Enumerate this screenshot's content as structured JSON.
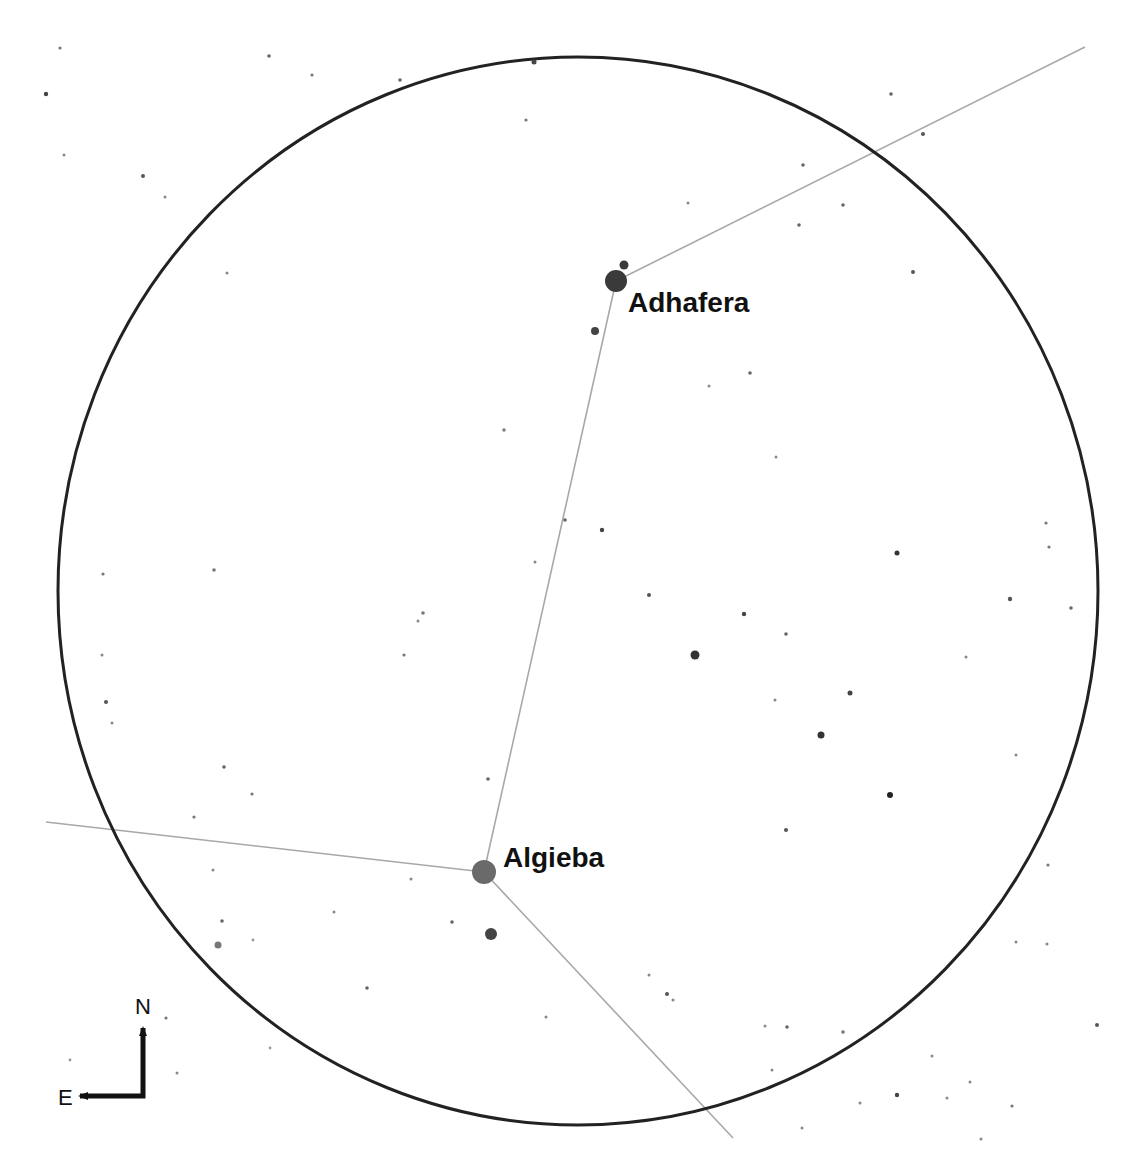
{
  "chart_title": "",
  "field_of_view": {
    "shape": "circle",
    "cx": 578,
    "cy": 591,
    "rx": 520,
    "ry": 534,
    "stroke": "#222222",
    "stroke_width": 3
  },
  "constellation_lines": {
    "color": "#a8a8a8",
    "width": 1.6,
    "segments": [
      {
        "from": [
          616,
          281
        ],
        "to": [
          1085,
          47
        ]
      },
      {
        "from": [
          616,
          281
        ],
        "to": [
          484,
          872
        ]
      },
      {
        "from": [
          484,
          872
        ],
        "to": [
          46,
          822
        ]
      },
      {
        "from": [
          484,
          872
        ],
        "to": [
          733,
          1138
        ]
      }
    ]
  },
  "named_stars": [
    {
      "name": "Adhafera",
      "x": 616,
      "y": 281,
      "r": 11,
      "color": "#3a3a3a",
      "label_x": 628,
      "label_y": 289
    },
    {
      "name": "Algieba",
      "x": 484,
      "y": 872,
      "r": 12,
      "color": "#6a6a6a",
      "label_x": 503,
      "label_y": 844
    }
  ],
  "stars": [
    {
      "x": 624,
      "y": 265,
      "r": 4.5,
      "c": "#3a3a3a"
    },
    {
      "x": 595,
      "y": 331,
      "r": 4,
      "c": "#444"
    },
    {
      "x": 491,
      "y": 934,
      "r": 6,
      "c": "#444"
    },
    {
      "x": 695,
      "y": 655,
      "r": 4.5,
      "c": "#333"
    },
    {
      "x": 821,
      "y": 735,
      "r": 3.5,
      "c": "#333"
    },
    {
      "x": 890,
      "y": 795,
      "r": 3,
      "c": "#222"
    },
    {
      "x": 218,
      "y": 945,
      "r": 3.5,
      "c": "#777"
    },
    {
      "x": 897,
      "y": 553,
      "r": 2.5,
      "c": "#333"
    },
    {
      "x": 850,
      "y": 693,
      "r": 2.5,
      "c": "#444"
    },
    {
      "x": 744,
      "y": 614,
      "r": 2.2,
      "c": "#444"
    },
    {
      "x": 649,
      "y": 595,
      "r": 2,
      "c": "#555"
    },
    {
      "x": 602,
      "y": 530,
      "r": 2.2,
      "c": "#444"
    },
    {
      "x": 565,
      "y": 520,
      "r": 1.8,
      "c": "#666"
    },
    {
      "x": 786,
      "y": 634,
      "r": 1.8,
      "c": "#666"
    },
    {
      "x": 775,
      "y": 700,
      "r": 1.5,
      "c": "#888"
    },
    {
      "x": 60,
      "y": 48,
      "r": 1.6,
      "c": "#777"
    },
    {
      "x": 46,
      "y": 94,
      "r": 2.2,
      "c": "#444"
    },
    {
      "x": 269,
      "y": 56,
      "r": 1.8,
      "c": "#666"
    },
    {
      "x": 312,
      "y": 75,
      "r": 1.6,
      "c": "#777"
    },
    {
      "x": 400,
      "y": 80,
      "r": 1.8,
      "c": "#666"
    },
    {
      "x": 534,
      "y": 62,
      "r": 2.5,
      "c": "#444"
    },
    {
      "x": 526,
      "y": 120,
      "r": 1.6,
      "c": "#777"
    },
    {
      "x": 64,
      "y": 155,
      "r": 1.5,
      "c": "#888"
    },
    {
      "x": 143,
      "y": 176,
      "r": 2,
      "c": "#555"
    },
    {
      "x": 165,
      "y": 197,
      "r": 1.5,
      "c": "#888"
    },
    {
      "x": 227,
      "y": 273,
      "r": 1.5,
      "c": "#888"
    },
    {
      "x": 504,
      "y": 430,
      "r": 1.7,
      "c": "#777"
    },
    {
      "x": 535,
      "y": 562,
      "r": 1.5,
      "c": "#888"
    },
    {
      "x": 891,
      "y": 94,
      "r": 1.8,
      "c": "#666"
    },
    {
      "x": 923,
      "y": 134,
      "r": 2,
      "c": "#555"
    },
    {
      "x": 803,
      "y": 165,
      "r": 1.8,
      "c": "#666"
    },
    {
      "x": 688,
      "y": 203,
      "r": 1.5,
      "c": "#888"
    },
    {
      "x": 843,
      "y": 205,
      "r": 1.8,
      "c": "#666"
    },
    {
      "x": 799,
      "y": 225,
      "r": 1.8,
      "c": "#666"
    },
    {
      "x": 913,
      "y": 272,
      "r": 2,
      "c": "#555"
    },
    {
      "x": 750,
      "y": 373,
      "r": 1.8,
      "c": "#666"
    },
    {
      "x": 709,
      "y": 386,
      "r": 1.5,
      "c": "#888"
    },
    {
      "x": 776,
      "y": 457,
      "r": 1.5,
      "c": "#888"
    },
    {
      "x": 1046,
      "y": 523,
      "r": 1.6,
      "c": "#777"
    },
    {
      "x": 1049,
      "y": 547,
      "r": 1.6,
      "c": "#777"
    },
    {
      "x": 1010,
      "y": 599,
      "r": 2.2,
      "c": "#555"
    },
    {
      "x": 1071,
      "y": 608,
      "r": 1.8,
      "c": "#666"
    },
    {
      "x": 966,
      "y": 657,
      "r": 1.5,
      "c": "#888"
    },
    {
      "x": 1016,
      "y": 755,
      "r": 1.5,
      "c": "#888"
    },
    {
      "x": 103,
      "y": 574,
      "r": 1.6,
      "c": "#777"
    },
    {
      "x": 214,
      "y": 570,
      "r": 1.8,
      "c": "#777"
    },
    {
      "x": 423,
      "y": 613,
      "r": 1.8,
      "c": "#777"
    },
    {
      "x": 418,
      "y": 621,
      "r": 1.5,
      "c": "#888"
    },
    {
      "x": 404,
      "y": 655,
      "r": 1.6,
      "c": "#777"
    },
    {
      "x": 102,
      "y": 655,
      "r": 1.5,
      "c": "#888"
    },
    {
      "x": 106,
      "y": 702,
      "r": 2,
      "c": "#555"
    },
    {
      "x": 112,
      "y": 723,
      "r": 1.5,
      "c": "#888"
    },
    {
      "x": 224,
      "y": 767,
      "r": 1.8,
      "c": "#666"
    },
    {
      "x": 252,
      "y": 794,
      "r": 1.6,
      "c": "#777"
    },
    {
      "x": 194,
      "y": 817,
      "r": 1.6,
      "c": "#777"
    },
    {
      "x": 488,
      "y": 779,
      "r": 1.8,
      "c": "#666"
    },
    {
      "x": 213,
      "y": 870,
      "r": 1.5,
      "c": "#888"
    },
    {
      "x": 222,
      "y": 921,
      "r": 1.8,
      "c": "#666"
    },
    {
      "x": 253,
      "y": 940,
      "r": 1.4,
      "c": "#999"
    },
    {
      "x": 334,
      "y": 912,
      "r": 1.5,
      "c": "#888"
    },
    {
      "x": 411,
      "y": 879,
      "r": 1.5,
      "c": "#888"
    },
    {
      "x": 452,
      "y": 922,
      "r": 1.8,
      "c": "#666"
    },
    {
      "x": 367,
      "y": 988,
      "r": 1.8,
      "c": "#666"
    },
    {
      "x": 166,
      "y": 1018,
      "r": 1.6,
      "c": "#777"
    },
    {
      "x": 270,
      "y": 1048,
      "r": 1.4,
      "c": "#999"
    },
    {
      "x": 177,
      "y": 1073,
      "r": 1.5,
      "c": "#888"
    },
    {
      "x": 70,
      "y": 1060,
      "r": 1.4,
      "c": "#999"
    },
    {
      "x": 786,
      "y": 830,
      "r": 2,
      "c": "#555"
    },
    {
      "x": 649,
      "y": 975,
      "r": 1.5,
      "c": "#888"
    },
    {
      "x": 667,
      "y": 994,
      "r": 2,
      "c": "#555"
    },
    {
      "x": 673,
      "y": 1000,
      "r": 1.5,
      "c": "#888"
    },
    {
      "x": 546,
      "y": 1017,
      "r": 1.5,
      "c": "#888"
    },
    {
      "x": 765,
      "y": 1026,
      "r": 1.5,
      "c": "#888"
    },
    {
      "x": 787,
      "y": 1027,
      "r": 1.8,
      "c": "#666"
    },
    {
      "x": 843,
      "y": 1032,
      "r": 1.8,
      "c": "#777"
    },
    {
      "x": 772,
      "y": 1070,
      "r": 1.5,
      "c": "#888"
    },
    {
      "x": 1048,
      "y": 865,
      "r": 1.6,
      "c": "#777"
    },
    {
      "x": 1016,
      "y": 942,
      "r": 1.5,
      "c": "#888"
    },
    {
      "x": 1047,
      "y": 944,
      "r": 1.5,
      "c": "#888"
    },
    {
      "x": 1097,
      "y": 1025,
      "r": 2,
      "c": "#555"
    },
    {
      "x": 932,
      "y": 1056,
      "r": 1.5,
      "c": "#888"
    },
    {
      "x": 970,
      "y": 1082,
      "r": 1.5,
      "c": "#888"
    },
    {
      "x": 897,
      "y": 1095,
      "r": 2.2,
      "c": "#444"
    },
    {
      "x": 860,
      "y": 1103,
      "r": 1.5,
      "c": "#888"
    },
    {
      "x": 947,
      "y": 1098,
      "r": 1.5,
      "c": "#888"
    },
    {
      "x": 1012,
      "y": 1106,
      "r": 1.6,
      "c": "#777"
    },
    {
      "x": 981,
      "y": 1139,
      "r": 1.5,
      "c": "#888"
    },
    {
      "x": 802,
      "y": 1128,
      "r": 1.5,
      "c": "#888"
    }
  ],
  "compass": {
    "north_label": "N",
    "east_label": "E",
    "corner_x": 143,
    "corner_y": 1096,
    "north_end_y": 1028,
    "east_end_x": 80,
    "n_label_x": 135,
    "n_label_y": 996,
    "e_label_x": 58,
    "e_label_y": 1087
  }
}
